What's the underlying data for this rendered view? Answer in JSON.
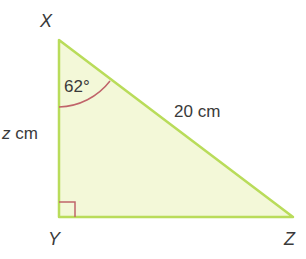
{
  "diagram": {
    "type": "right-triangle",
    "vertices": {
      "X": {
        "label": "X",
        "x": 59,
        "y": 40
      },
      "Y": {
        "label": "Y",
        "x": 59,
        "y": 217
      },
      "Z": {
        "label": "Z",
        "x": 293,
        "y": 217
      }
    },
    "angle_label": "62°",
    "hypotenuse_label": "20 cm",
    "side_label_var": "z",
    "side_label_unit": " cm",
    "right_angle_at": "Y",
    "colors": {
      "fill": "#f3f8d8",
      "stroke": "#b9dc5a",
      "angle_mark": "#c0646a",
      "text": "#3a3a3a"
    }
  }
}
